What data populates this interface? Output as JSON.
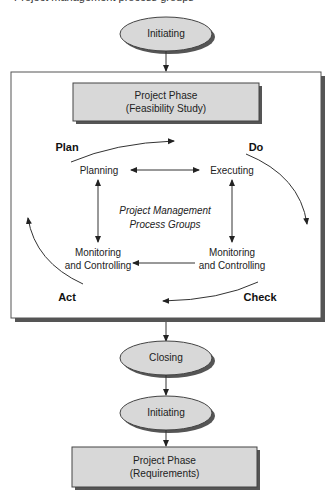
{
  "caption": "Project management process groups",
  "colors": {
    "node_fill": "#d8d8d8",
    "node_stroke": "#444444",
    "shadow": "#555555",
    "line": "#333333",
    "background": "#ffffff"
  },
  "top_initiating": {
    "label": "Initiating"
  },
  "phase_1": {
    "line1": "Project Phase",
    "line2": "(Feasibility Study)"
  },
  "cycle": {
    "labels": {
      "plan": "Plan",
      "do": "Do",
      "check": "Check",
      "act": "Act"
    },
    "processes": {
      "planning": "Planning",
      "executing": "Executing",
      "monitoring_left_line1": "Monitoring",
      "monitoring_left_line2": "and Controlling",
      "monitoring_right_line1": "Monitoring",
      "monitoring_right_line2": "and Controlling"
    },
    "center": {
      "line1": "Project Management",
      "line2": "Process Groups"
    }
  },
  "closing": {
    "label": "Closing"
  },
  "next_initiating": {
    "label": "Initiating"
  },
  "phase_2": {
    "line1": "Project Phase",
    "line2": "(Requirements)"
  }
}
